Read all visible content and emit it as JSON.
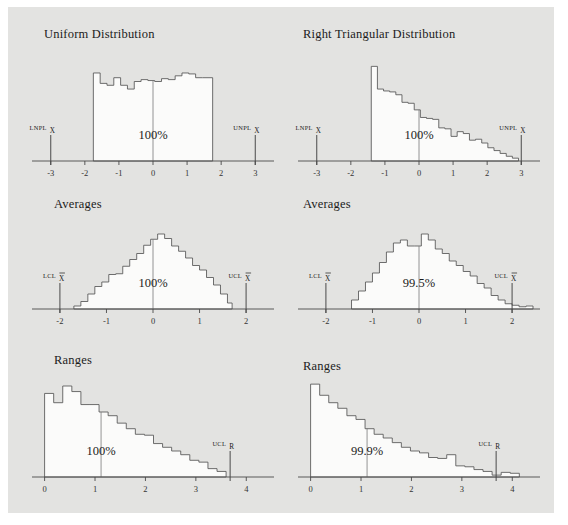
{
  "figure": {
    "background_color": "#e3e3e1",
    "page_color": "#ffffff",
    "width": 568,
    "height": 525
  },
  "chart_data": [
    {
      "id": "uniform-distribution",
      "type": "bar",
      "title": "Uniform Distribution",
      "xlabel": "",
      "ylabel": "",
      "xlim": [
        -3.55,
        3.55
      ],
      "ylim": [
        0,
        1.12
      ],
      "grid": false,
      "legend": "none",
      "tick_labels": [
        "-3",
        "-2",
        "-1",
        "0",
        "1",
        "2",
        "3"
      ],
      "tick_values": [
        -3,
        -2,
        -1,
        0,
        1,
        2,
        3
      ],
      "center_value": 0,
      "percent_label": "100%",
      "annotations": [
        {
          "name": "lower-limit",
          "text": "LNPL",
          "subscript": "X",
          "subscript_bar": false,
          "value": -3.0
        },
        {
          "name": "upper-limit",
          "text": "UNPL",
          "subscript": "X",
          "subscript_bar": false,
          "value": 3.0
        }
      ],
      "bin_edges": [
        -1.75,
        -1.55,
        -1.35,
        -1.15,
        -0.95,
        -0.75,
        -0.55,
        -0.35,
        -0.15,
        0.05,
        0.25,
        0.45,
        0.65,
        0.85,
        1.05,
        1.25,
        1.45,
        1.75
      ],
      "values": [
        0.93,
        0.82,
        0.8,
        0.88,
        0.8,
        0.76,
        0.84,
        0.86,
        0.85,
        0.84,
        0.87,
        0.86,
        0.9,
        0.93,
        0.92,
        0.88,
        0.88
      ]
    },
    {
      "id": "right-triangular-distribution",
      "type": "bar",
      "title": "Right Triangular Distribution",
      "xlabel": "",
      "ylabel": "",
      "xlim": [
        -3.55,
        3.55
      ],
      "ylim": [
        0,
        1.12
      ],
      "grid": false,
      "legend": "none",
      "tick_labels": [
        "-3",
        "-2",
        "-1",
        "0",
        "1",
        "2",
        "3"
      ],
      "tick_values": [
        -3,
        -2,
        -1,
        0,
        1,
        2,
        3
      ],
      "center_value": 0,
      "percent_label": "100%",
      "annotations": [
        {
          "name": "lower-limit",
          "text": "LNPL",
          "subscript": "X",
          "subscript_bar": false,
          "value": -3.0
        },
        {
          "name": "upper-limit",
          "text": "UNPL",
          "subscript": "X",
          "subscript_bar": false,
          "value": 3.0
        }
      ],
      "bin_edges": [
        -1.4,
        -1.22,
        -1.04,
        -0.86,
        -0.68,
        -0.5,
        -0.32,
        -0.14,
        0.04,
        0.22,
        0.4,
        0.58,
        0.76,
        0.94,
        1.12,
        1.3,
        1.48,
        1.66,
        1.84,
        2.02,
        2.2,
        2.38,
        2.56,
        2.74,
        2.92
      ],
      "values": [
        1.0,
        0.76,
        0.74,
        0.73,
        0.7,
        0.62,
        0.61,
        0.54,
        0.46,
        0.45,
        0.44,
        0.35,
        0.34,
        0.26,
        0.31,
        0.29,
        0.22,
        0.23,
        0.19,
        0.14,
        0.11,
        0.08,
        0.05,
        0.03
      ]
    },
    {
      "id": "averages-uniform",
      "type": "bar",
      "title": "Averages",
      "xlabel": "",
      "ylabel": "",
      "xlim": [
        -2.6,
        2.6
      ],
      "ylim": [
        0,
        1.12
      ],
      "grid": false,
      "legend": "none",
      "tick_labels": [
        "-2",
        "-1",
        "0",
        "1",
        "2"
      ],
      "tick_values": [
        -2,
        -1,
        0,
        1,
        2
      ],
      "center_value": 0,
      "percent_label": "100%",
      "annotations": [
        {
          "name": "lower-control-limit",
          "text": "LCL",
          "subscript": "X",
          "subscript_bar": true,
          "value": -2.0
        },
        {
          "name": "upper-control-limit",
          "text": "UCL",
          "subscript": "X",
          "subscript_bar": true,
          "value": 2.0
        }
      ],
      "bin_edges": [
        -1.7,
        -1.55,
        -1.4,
        -1.25,
        -1.1,
        -0.95,
        -0.8,
        -0.65,
        -0.5,
        -0.35,
        -0.2,
        -0.05,
        0.1,
        0.25,
        0.4,
        0.55,
        0.7,
        0.85,
        1.0,
        1.15,
        1.3,
        1.45,
        1.6,
        1.7
      ],
      "values": [
        0.04,
        0.1,
        0.2,
        0.3,
        0.36,
        0.46,
        0.47,
        0.57,
        0.66,
        0.74,
        0.85,
        0.93,
        1.0,
        0.94,
        0.84,
        0.77,
        0.68,
        0.58,
        0.52,
        0.42,
        0.32,
        0.2,
        0.08
      ]
    },
    {
      "id": "averages-triangular",
      "type": "bar",
      "title": "Averages",
      "xlabel": "",
      "ylabel": "",
      "xlim": [
        -2.6,
        2.6
      ],
      "ylim": [
        0,
        1.12
      ],
      "grid": false,
      "legend": "none",
      "tick_labels": [
        "-2",
        "-1",
        "0",
        "1",
        "2"
      ],
      "tick_values": [
        -2,
        -1,
        0,
        1,
        2
      ],
      "center_value": 0,
      "percent_label": "99.5%",
      "annotations": [
        {
          "name": "lower-control-limit",
          "text": "LCL",
          "subscript": "X",
          "subscript_bar": true,
          "value": -2.0
        },
        {
          "name": "upper-control-limit",
          "text": "UCL",
          "subscript": "X",
          "subscript_bar": true,
          "value": 2.0
        }
      ],
      "bin_edges": [
        -1.45,
        -1.3,
        -1.15,
        -1.0,
        -0.85,
        -0.7,
        -0.55,
        -0.4,
        -0.25,
        -0.1,
        0.05,
        0.2,
        0.35,
        0.5,
        0.65,
        0.8,
        0.95,
        1.1,
        1.25,
        1.4,
        1.55,
        1.7,
        1.85,
        2.0,
        2.15,
        2.3,
        2.45
      ],
      "values": [
        0.12,
        0.24,
        0.36,
        0.48,
        0.62,
        0.76,
        0.88,
        0.92,
        0.84,
        0.84,
        1.0,
        0.92,
        0.8,
        0.74,
        0.64,
        0.58,
        0.5,
        0.44,
        0.34,
        0.28,
        0.18,
        0.12,
        0.07,
        0.05,
        0.03,
        0.04
      ]
    },
    {
      "id": "ranges-uniform",
      "type": "bar",
      "title": "Ranges",
      "xlabel": "",
      "ylabel": "",
      "xlim": [
        -0.25,
        4.55
      ],
      "ylim": [
        0,
        1.12
      ],
      "grid": false,
      "legend": "none",
      "tick_labels": [
        "0",
        "1",
        "2",
        "3",
        "4"
      ],
      "tick_values": [
        0,
        1,
        2,
        3,
        4
      ],
      "center_value": 1.12,
      "percent_label": "100%",
      "annotations": [
        {
          "name": "upper-control-limit",
          "text": "UCL",
          "subscript": "R",
          "subscript_bar": false,
          "value": 3.68
        }
      ],
      "bin_edges": [
        0.0,
        0.18,
        0.36,
        0.54,
        0.72,
        0.9,
        1.08,
        1.26,
        1.44,
        1.62,
        1.8,
        1.98,
        2.16,
        2.34,
        2.52,
        2.7,
        2.88,
        3.06,
        3.24,
        3.42,
        3.6
      ],
      "values": [
        0.9,
        0.8,
        0.98,
        0.92,
        0.78,
        0.78,
        0.7,
        0.66,
        0.58,
        0.52,
        0.46,
        0.45,
        0.36,
        0.32,
        0.28,
        0.24,
        0.18,
        0.16,
        0.09,
        0.06
      ]
    },
    {
      "id": "ranges-triangular",
      "type": "bar",
      "title": "Ranges",
      "xlabel": "",
      "ylabel": "",
      "xlim": [
        -0.25,
        4.55
      ],
      "ylim": [
        0,
        1.12
      ],
      "grid": false,
      "legend": "none",
      "tick_labels": [
        "0",
        "1",
        "2",
        "3",
        "4"
      ],
      "tick_values": [
        0,
        1,
        2,
        3,
        4
      ],
      "center_value": 1.12,
      "percent_label": "99.9%",
      "annotations": [
        {
          "name": "upper-control-limit",
          "text": "UCL",
          "subscript": "R",
          "subscript_bar": false,
          "value": 3.68
        }
      ],
      "bin_edges": [
        0.0,
        0.18,
        0.36,
        0.54,
        0.72,
        0.9,
        1.08,
        1.26,
        1.44,
        1.62,
        1.8,
        1.98,
        2.16,
        2.34,
        2.52,
        2.7,
        2.88,
        3.06,
        3.24,
        3.42,
        3.6,
        3.78,
        3.96,
        4.14
      ],
      "values": [
        1.0,
        0.88,
        0.8,
        0.74,
        0.66,
        0.62,
        0.52,
        0.46,
        0.42,
        0.37,
        0.32,
        0.28,
        0.26,
        0.21,
        0.2,
        0.24,
        0.12,
        0.11,
        0.08,
        0.06,
        0.02,
        0.05,
        0.04
      ]
    }
  ],
  "panels": {
    "layout": [
      {
        "chart_index": 0,
        "left": 14,
        "top": 18,
        "width": 262,
        "height": 162,
        "title_left": 36,
        "title_top": 20
      },
      {
        "chart_index": 1,
        "left": 280,
        "top": 18,
        "width": 262,
        "height": 162,
        "title_left": 295,
        "title_top": 20
      },
      {
        "chart_index": 2,
        "left": 14,
        "top": 188,
        "width": 262,
        "height": 140,
        "title_left": 46,
        "title_top": 190
      },
      {
        "chart_index": 3,
        "left": 280,
        "top": 188,
        "width": 262,
        "height": 140,
        "title_left": 295,
        "title_top": 190
      },
      {
        "chart_index": 4,
        "left": 14,
        "top": 336,
        "width": 262,
        "height": 160,
        "title_left": 46,
        "title_top": 346
      },
      {
        "chart_index": 5,
        "left": 280,
        "top": 336,
        "width": 262,
        "height": 160,
        "title_left": 295,
        "title_top": 352
      }
    ]
  }
}
